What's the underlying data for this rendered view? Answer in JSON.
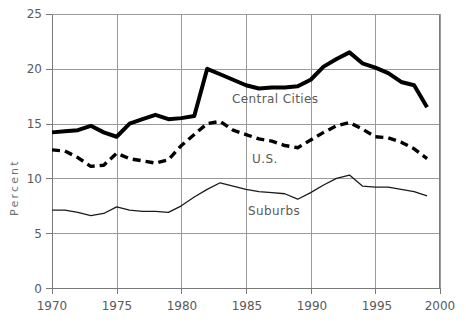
{
  "chart_data": {
    "type": "line",
    "title": "",
    "subtitle": "",
    "xlabel": "",
    "ylabel": "Percent",
    "xlim": [
      1970,
      2000
    ],
    "ylim": [
      0,
      25
    ],
    "grid": true,
    "legend_position": "inline-annotations",
    "xticks": [
      "1970",
      "1975",
      "1980",
      "1985",
      "1990",
      "1995",
      "2000"
    ],
    "yticks": [
      "0",
      "5",
      "10",
      "15",
      "20",
      "25"
    ],
    "x": [
      1970,
      1971,
      1972,
      1973,
      1974,
      1975,
      1976,
      1977,
      1978,
      1979,
      1980,
      1981,
      1982,
      1983,
      1984,
      1985,
      1986,
      1987,
      1988,
      1989,
      1990,
      1991,
      1992,
      1993,
      1994,
      1995,
      1996,
      1997,
      1998,
      1999
    ],
    "series": [
      {
        "name": "Central Cities",
        "style": "thick-solid",
        "color": "#000000",
        "values": [
          14.2,
          14.3,
          14.4,
          14.8,
          14.2,
          13.8,
          15.0,
          15.4,
          15.8,
          15.4,
          15.5,
          15.7,
          20.0,
          19.5,
          19.0,
          18.5,
          18.2,
          18.3,
          18.3,
          18.4,
          19.0,
          20.2,
          20.9,
          21.5,
          20.5,
          20.1,
          19.6,
          18.8,
          18.5,
          16.5
        ]
      },
      {
        "name": "U.S.",
        "style": "dashed",
        "color": "#000000",
        "values": [
          12.6,
          12.5,
          11.9,
          11.1,
          11.2,
          12.3,
          11.8,
          11.6,
          11.4,
          11.7,
          13.0,
          14.0,
          15.0,
          15.2,
          14.4,
          14.0,
          13.6,
          13.4,
          13.0,
          12.8,
          13.5,
          14.2,
          14.8,
          15.1,
          14.5,
          13.8,
          13.7,
          13.3,
          12.7,
          11.8
        ]
      },
      {
        "name": "Suburbs",
        "style": "thin-solid",
        "color": "#1a1a1a",
        "values": [
          7.1,
          7.1,
          6.9,
          6.6,
          6.8,
          7.4,
          7.1,
          7.0,
          7.0,
          6.9,
          7.5,
          8.3,
          9.0,
          9.6,
          9.3,
          9.0,
          8.8,
          8.7,
          8.6,
          8.1,
          8.7,
          9.4,
          10.0,
          10.3,
          9.3,
          9.2,
          9.2,
          9.0,
          8.8,
          8.4
        ]
      }
    ],
    "annotations": [
      {
        "text": "Central Cities",
        "x": 1989.5,
        "y": 17.6
      },
      {
        "text": "U.S.",
        "x": 1988.0,
        "y": 12.1
      },
      {
        "text": "Suburbs",
        "x": 1988.0,
        "y": 6.6
      }
    ],
    "colors": {
      "grid": "#9a9a9a",
      "axis": "#7a7a7a",
      "text": "#5a5a5a",
      "background": "#ffffff"
    }
  }
}
